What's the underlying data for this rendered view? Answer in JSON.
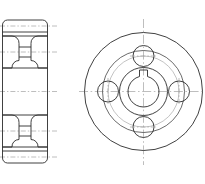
{
  "drawing": {
    "title": "Flanged Hub / Pulley — Two-View Orthographic Drawing",
    "sheet_background": "#ffffff",
    "line_color_visible": "#2b2b2b",
    "line_color_center": "#9a9a9a",
    "views": [
      {
        "id": "section-view",
        "name": "Front Section View",
        "label": "",
        "outline": {
          "x": 2.5,
          "y": 20.0,
          "width": 45.0,
          "height": 143.0,
          "corner_radius_top": 5.0,
          "corner_radius_bottom": 5.0
        },
        "horizontal_divisions_y": [
          32.0,
          151.0
        ],
        "grooves": [
          {
            "id": "upper-groove",
            "top": 36.0,
            "bottom": 68.0,
            "web_top": 47.0,
            "web_bottom": 57.0,
            "left_face_x": 2.5,
            "right_face_x": 47.5,
            "neck_left_x": 17.0,
            "neck_right_x": 33.0,
            "fillet_radius": 6.5
          },
          {
            "id": "lower-groove",
            "top": 115.0,
            "bottom": 147.0,
            "web_top": 126.0,
            "web_bottom": 136.0,
            "left_face_x": 2.5,
            "right_face_x": 47.5,
            "neck_left_x": 17.0,
            "neck_right_x": 33.0,
            "fillet_radius": 6.5
          }
        ],
        "centerlines_y": [
          26.0,
          52.0,
          91.5,
          131.0,
          157.0
        ]
      },
      {
        "id": "end-view",
        "name": "End / Plan View",
        "label": "",
        "center": {
          "x": 143.5,
          "y": 91.5
        },
        "circles": [
          {
            "id": "flange-outer-diameter",
            "r": 59.0,
            "style": "visible"
          },
          {
            "id": "hub-outer-diameter",
            "r": 41.0,
            "style": "visible"
          },
          {
            "id": "bolt-circle",
            "r": 35.5,
            "style": "pitch"
          },
          {
            "id": "boss-diameter",
            "r": 24.0,
            "style": "visible"
          },
          {
            "id": "bore-diameter",
            "r": 15.5,
            "style": "visible"
          }
        ],
        "keyway": {
          "id": "keyway-slot",
          "position": "top",
          "width": 8.0,
          "depth_above_bore": 6.0
        },
        "bolt_holes": [
          {
            "id": "bolt-hole-top",
            "cx": 143.5,
            "cy": 56.0,
            "r": 10.5,
            "angle_deg": 90
          },
          {
            "id": "bolt-hole-right",
            "cx": 179.0,
            "cy": 91.5,
            "r": 10.5,
            "angle_deg": 0
          },
          {
            "id": "bolt-hole-bottom",
            "cx": 143.5,
            "cy": 127.0,
            "r": 10.5,
            "angle_deg": 270
          },
          {
            "id": "bolt-hole-left",
            "cx": 108.0,
            "cy": 91.5,
            "r": 10.5,
            "angle_deg": 180
          }
        ],
        "bolt_hole_count": 4,
        "centerline_horizontal": {
          "x1": 79.0,
          "x2": 208.0,
          "y": 91.5
        },
        "centerline_vertical": {
          "y1": 19.0,
          "y2": 165.0,
          "x": 143.5
        }
      }
    ]
  }
}
